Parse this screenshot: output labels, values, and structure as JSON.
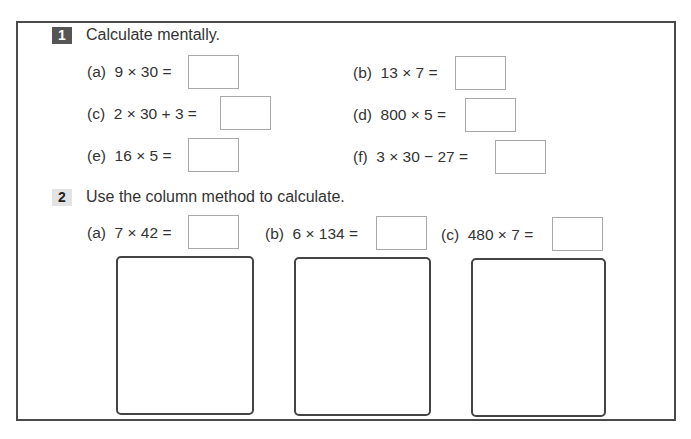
{
  "section1": {
    "number": "1",
    "instruction": "Calculate mentally.",
    "questions": [
      {
        "label": "(a)",
        "expression": "9 × 30 =",
        "answer": ""
      },
      {
        "label": "(b)",
        "expression": "13 × 7 =",
        "answer": ""
      },
      {
        "label": "(c)",
        "expression": "2 × 30 + 3 =",
        "answer": ""
      },
      {
        "label": "(d)",
        "expression": "800 × 5 =",
        "answer": ""
      },
      {
        "label": "(e)",
        "expression": "16 × 5 =",
        "answer": ""
      },
      {
        "label": "(f)",
        "expression": "3 × 30 − 27 =",
        "answer": ""
      }
    ]
  },
  "section2": {
    "number": "2",
    "instruction": "Use the column method to calculate.",
    "questions": [
      {
        "label": "(a)",
        "expression": "7 × 42 =",
        "answer": "",
        "working": ""
      },
      {
        "label": "(b)",
        "expression": "6 × 134 =",
        "answer": "",
        "working": ""
      },
      {
        "label": "(c)",
        "expression": "480 × 7 =",
        "answer": "",
        "working": ""
      }
    ]
  }
}
